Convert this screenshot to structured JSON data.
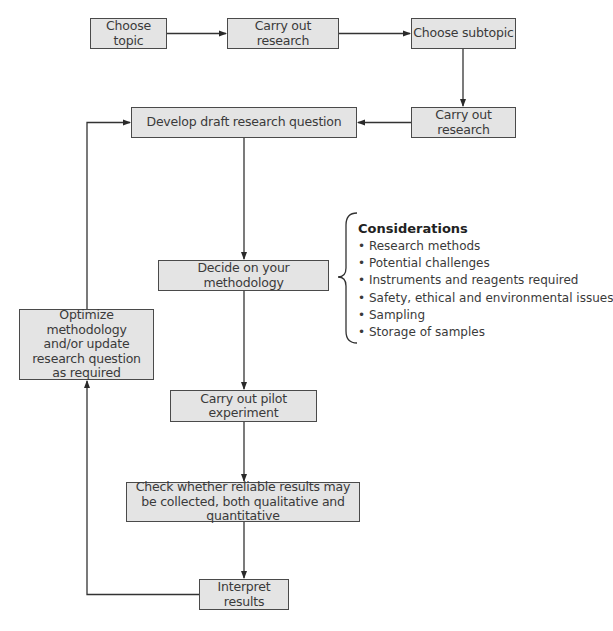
{
  "colors": {
    "box_fill": "#e4e4e4",
    "box_border": "#4a4a4a",
    "line": "#333333"
  },
  "nodes": {
    "choose_topic": "Choose topic",
    "carry_out_research_1": "Carry out research",
    "choose_subtopic": "Choose subtopic",
    "carry_out_research_2": "Carry out research",
    "develop_question": "Develop draft research question",
    "decide_methodology": "Decide on your methodology",
    "pilot_experiment": "Carry out pilot experiment",
    "check_results": "Check whether reliable results may be collected, both qualitative and quantitative",
    "interpret_results": "Interpret results",
    "optimize": "Optimize methodology and/or update research question as required"
  },
  "considerations": {
    "title": "Considerations",
    "items": [
      "Research methods",
      "Potential challenges",
      "Instruments and reagents required",
      "Safety, ethical and environmental issues",
      "Sampling",
      "Storage of samples"
    ]
  },
  "edges": [
    {
      "from": "choose_topic",
      "to": "carry_out_research_1"
    },
    {
      "from": "carry_out_research_1",
      "to": "choose_subtopic"
    },
    {
      "from": "choose_subtopic",
      "to": "carry_out_research_2"
    },
    {
      "from": "carry_out_research_2",
      "to": "develop_question"
    },
    {
      "from": "develop_question",
      "to": "decide_methodology"
    },
    {
      "from": "decide_methodology",
      "to": "pilot_experiment"
    },
    {
      "from": "pilot_experiment",
      "to": "check_results"
    },
    {
      "from": "check_results",
      "to": "interpret_results"
    },
    {
      "from": "interpret_results",
      "to": "optimize"
    },
    {
      "from": "optimize",
      "to": "develop_question"
    }
  ]
}
